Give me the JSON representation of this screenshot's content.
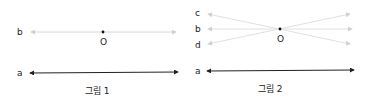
{
  "figure1": {
    "caption": "그림 1",
    "labels": {
      "b": "b",
      "a": "a",
      "o": "O"
    }
  },
  "figure2": {
    "caption": "그림 2",
    "labels": {
      "c": "c",
      "b": "b",
      "d": "d",
      "a": "a",
      "o": "O"
    }
  },
  "colors": {
    "faint_line": "#d8d8d8",
    "dark_line": "#222222",
    "point": "#111111"
  }
}
